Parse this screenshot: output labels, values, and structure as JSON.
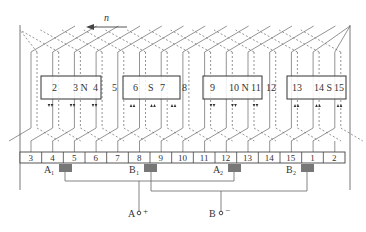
{
  "rotation": {
    "label": "n",
    "direction": "left"
  },
  "poles": [
    {
      "name": "N",
      "slots": [
        "2",
        "3",
        "4"
      ],
      "slot_labels": [
        "2",
        "3 N",
        "4"
      ]
    },
    {
      "name": "S",
      "slots": [
        "6",
        "7"
      ],
      "slot_labels": [
        "6",
        "S",
        "7"
      ]
    },
    {
      "name": "N",
      "slots": [
        "9",
        "10",
        "11"
      ],
      "slot_labels": [
        "9",
        "10 N",
        "11"
      ]
    },
    {
      "name": "S",
      "slots": [
        "13",
        "14",
        "15"
      ],
      "slot_labels": [
        "13",
        "14 S",
        "15"
      ]
    }
  ],
  "gap_slots": [
    "5",
    "8",
    "12"
  ],
  "commutator_segments": [
    "3",
    "4",
    "5",
    "6",
    "7",
    "8",
    "9",
    "10",
    "11",
    "12",
    "13",
    "14",
    "15",
    "1",
    "2"
  ],
  "brushes": [
    {
      "label": "A",
      "sub": "1",
      "segment_between": [
        "4",
        "5"
      ]
    },
    {
      "label": "B",
      "sub": "1",
      "segment_between": [
        "8",
        "9"
      ]
    },
    {
      "label": "A",
      "sub": "2",
      "segment_between": [
        "11",
        "12"
      ]
    },
    {
      "label": "B",
      "sub": "2",
      "segment_between": [
        "15",
        "1"
      ]
    }
  ],
  "terminals": [
    {
      "label": "A",
      "polarity": "+"
    },
    {
      "label": "B",
      "polarity": "−"
    }
  ],
  "colors": {
    "line": "#555555",
    "brush": "#777777",
    "box": "#333333"
  }
}
